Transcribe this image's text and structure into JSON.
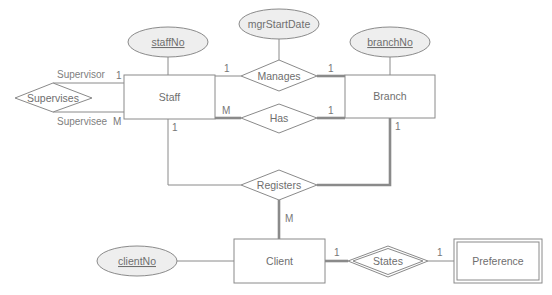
{
  "diagram": {
    "type": "ER diagram",
    "entities": {
      "staff": {
        "label": "Staff"
      },
      "branch": {
        "label": "Branch"
      },
      "client": {
        "label": "Client"
      },
      "preference": {
        "label": "Preference",
        "weak": true
      }
    },
    "attributes": {
      "staffNo": {
        "label": "staffNo",
        "key": true
      },
      "mgrStartDate": {
        "label": "mgrStartDate",
        "key": false
      },
      "branchNo": {
        "label": "branchNo",
        "key": true
      },
      "clientNo": {
        "label": "clientNo",
        "key": true
      }
    },
    "relationships": {
      "supervises": {
        "label": "Supervises"
      },
      "manages": {
        "label": "Manages"
      },
      "has": {
        "label": "Has"
      },
      "registers": {
        "label": "Registers"
      },
      "states": {
        "label": "States",
        "identifying": true
      }
    },
    "roles": {
      "supervisor": "Supervisor",
      "supervisee": "Supervisee"
    },
    "cardinalities": {
      "supervisor": "1",
      "supervisee": "M",
      "manages_staff": "1",
      "manages_branch": "1",
      "has_staff": "M",
      "has_branch": "1",
      "registers_staff": "1",
      "registers_branch": "1",
      "registers_client": "M",
      "states_client": "1",
      "states_preference": "1"
    },
    "colors": {
      "line": "#8a8a8a",
      "attribute_fill": "#eeeeee",
      "text": "#6e6e6e"
    }
  }
}
